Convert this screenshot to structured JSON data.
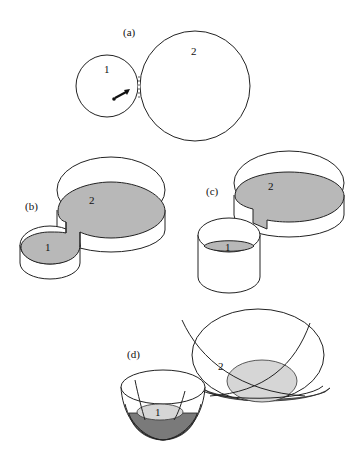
{
  "figure": {
    "panels": [
      {
        "id": "a",
        "label": "(a)",
        "regions": [
          "1",
          "2"
        ],
        "description": "Two touching circles, small circle 1 and large circle 2, with an arrow in circle 1 pointing to the contact point"
      },
      {
        "id": "b",
        "label": "(b)",
        "regions": [
          "1",
          "2"
        ],
        "description": "Two connected cylindrical containers of equal fluid level joined by a channel"
      },
      {
        "id": "c",
        "label": "(c)",
        "regions": [
          "1",
          "2"
        ],
        "description": "Two connected cylindrical containers with lower level in container 1"
      },
      {
        "id": "d",
        "label": "(d)",
        "regions": [
          "1",
          "2"
        ],
        "description": "Two paraboloid bowls, small bowl 1 and large bowl 2, with shaded fluid levels"
      }
    ],
    "colors": {
      "line": "#222222",
      "fluid": "#b8b8b8",
      "fluid_light": "#d6d6d6",
      "bowl_dark": "#7a7a7a",
      "background": "#ffffff"
    }
  }
}
